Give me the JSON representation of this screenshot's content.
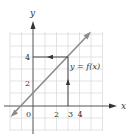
{
  "diagram": {
    "type": "function-graph",
    "axes": {
      "x_label": "x",
      "y_label": "y",
      "origin_label": "0",
      "x_ticks": [
        "2",
        "3",
        "4"
      ],
      "y_ticks": [
        "2",
        "4"
      ]
    },
    "curve_label": "y = f(x)",
    "curve": {
      "form": "line",
      "through": [
        [
          -1,
          0
        ],
        [
          0,
          1
        ],
        [
          3,
          4
        ]
      ],
      "arrows": "both-ends"
    },
    "mapping_arrows": [
      {
        "from": [
          3,
          0
        ],
        "to": [
          3,
          4
        ],
        "direction": "up"
      },
      {
        "from": [
          3,
          4
        ],
        "to": [
          0,
          4
        ],
        "direction": "left"
      }
    ],
    "colors": {
      "grid": "#d9d9d9",
      "axes": "#555555",
      "curve": "#8c8c8c",
      "arrows": "#333333",
      "text": "#333333"
    }
  }
}
